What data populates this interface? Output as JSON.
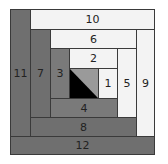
{
  "diagram": {
    "title": "",
    "type": "log-cabin-quilt-block",
    "colors": {
      "dark": "#6f6f6f",
      "medium": "#7a7a7a",
      "light": "#f3f3f3",
      "center_dark": "#000000",
      "center_light": "#9a9a9a"
    },
    "pieces": [
      {
        "label": "1",
        "shade": "light"
      },
      {
        "label": "2",
        "shade": "light"
      },
      {
        "label": "3",
        "shade": "medium"
      },
      {
        "label": "4",
        "shade": "medium"
      },
      {
        "label": "5",
        "shade": "light"
      },
      {
        "label": "6",
        "shade": "light"
      },
      {
        "label": "7",
        "shade": "dark"
      },
      {
        "label": "8",
        "shade": "dark"
      },
      {
        "label": "9",
        "shade": "light"
      },
      {
        "label": "10",
        "shade": "light"
      },
      {
        "label": "11",
        "shade": "dark"
      },
      {
        "label": "12",
        "shade": "dark"
      }
    ],
    "center": {
      "description": "half-square triangle, black lower-left, gray upper-right"
    }
  }
}
